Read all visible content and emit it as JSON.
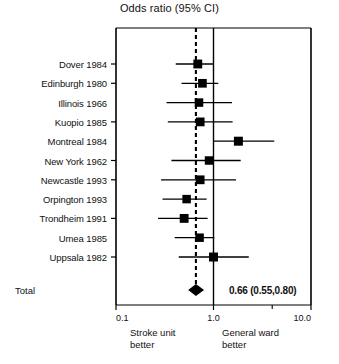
{
  "chart_data": {
    "type": "forest",
    "title": "Odds ratio (95% CI)",
    "xlabel": "",
    "ylabel": "",
    "xscale": "log",
    "xlim": [
      0.1,
      10.0
    ],
    "xticks": [
      0.1,
      1.0,
      10.0
    ],
    "xtick_labels": [
      "0.1",
      "1.0",
      "10.0"
    ],
    "grid": false,
    "legend": "none",
    "reference_line": 1.0,
    "pooled_line": 0.66,
    "left_side_label": "Stroke unit\nbetter",
    "right_side_label": "General ward\nbetter",
    "categories": [
      "Dover 1984",
      "Edinburgh 1980",
      "Illinois 1966",
      "Kuopio 1985",
      "Montreal 1984",
      "New York 1962",
      "Newcastle 1993",
      "Orpington 1993",
      "Trondheim 1991",
      "Umea 1985",
      "Uppsala 1982"
    ],
    "studies": [
      {
        "label": "Dover 1984",
        "or": 0.69,
        "lo": 0.41,
        "hi": 1.0,
        "weight": 0.52
      },
      {
        "label": "Edinburgh 1980",
        "or": 0.77,
        "lo": 0.47,
        "hi": 1.12,
        "weight": 0.48
      },
      {
        "label": "Illinois 1966",
        "or": 0.71,
        "lo": 0.33,
        "hi": 1.55,
        "weight": 0.44
      },
      {
        "label": "Kuopio 1985",
        "or": 0.73,
        "lo": 0.34,
        "hi": 1.57,
        "weight": 0.5
      },
      {
        "label": "Montreal 1984",
        "or": 1.8,
        "lo": 1.0,
        "hi": 4.2,
        "weight": 0.55
      },
      {
        "label": "New York 1962",
        "or": 0.9,
        "lo": 0.37,
        "hi": 1.9,
        "weight": 0.44
      },
      {
        "label": "Newcastle 1993",
        "or": 0.73,
        "lo": 0.29,
        "hi": 1.7,
        "weight": 0.5
      },
      {
        "label": "Orpington 1993",
        "or": 0.53,
        "lo": 0.3,
        "hi": 0.85,
        "weight": 0.44
      },
      {
        "label": "Trondheim 1991",
        "or": 0.5,
        "lo": 0.27,
        "hi": 0.87,
        "weight": 0.52
      },
      {
        "label": "Umea 1985",
        "or": 0.72,
        "lo": 0.4,
        "hi": 1.02,
        "weight": 0.44
      },
      {
        "label": "Uppsala 1982",
        "or": 1.0,
        "lo": 0.44,
        "hi": 2.3,
        "weight": 0.55
      }
    ],
    "total": {
      "label": "Total",
      "or": 0.66,
      "lo": 0.55,
      "hi": 0.8,
      "text": "0.66 (0.55,0.80)"
    }
  },
  "style": {
    "marker_color": "#000000",
    "line_color": "#000000",
    "axis_color": "#000000",
    "background": "#ffffff"
  }
}
